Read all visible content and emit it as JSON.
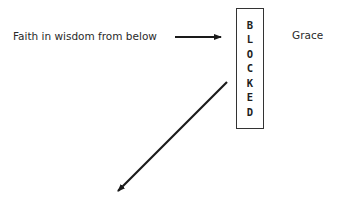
{
  "diagram": {
    "left_label": "Faith in wisdom from below",
    "right_label": "Grace",
    "blocked_box": {
      "letters": [
        "B",
        "L",
        "O",
        "C",
        "K",
        "E",
        "D"
      ],
      "word": "BLOCKED"
    },
    "arrows": [
      {
        "name": "horizontal-arrow",
        "from": [
          175,
          37
        ],
        "to": [
          222,
          37
        ],
        "direction": "right"
      },
      {
        "name": "diagonal-arrow",
        "from": [
          227,
          82
        ],
        "to": [
          117,
          192
        ],
        "direction": "down-left"
      }
    ],
    "colors": {
      "line": "#1a1a1a",
      "text": "#2a2a2a",
      "background": "#ffffff"
    }
  }
}
